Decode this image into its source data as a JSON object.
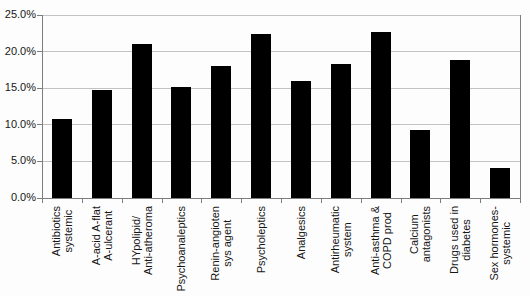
{
  "chart_data": {
    "type": "bar",
    "title": "",
    "categories": [
      "Antibiotics systemic",
      "A-acid A-flat A-ulcerant",
      "HYpolipid/ Anti-atheroma",
      "Psychoanaleptics",
      "Renin-angioten sys agent",
      "Psycholeptics",
      "Analgesics",
      "Antirheumatic system",
      "Anti-asthma & COPD prod",
      "Calcium antagonists",
      "Drugs used in diabetes",
      "Sex hormones- systemic"
    ],
    "category_lines": [
      [
        "Antibiotics",
        "systemic"
      ],
      [
        "A-acid A-flat",
        "A-ulcerant"
      ],
      [
        "HYpolipid/",
        "Anti-atheroma"
      ],
      [
        "Psychoanaleptics"
      ],
      [
        "Renin-angioten",
        "sys agent"
      ],
      [
        "Psycholeptics"
      ],
      [
        "Analgesics"
      ],
      [
        "Antirheumatic",
        "system"
      ],
      [
        "Anti-asthma &",
        "COPD prod"
      ],
      [
        "Calcium",
        "antagonists"
      ],
      [
        "Drugs used in",
        "diabetes"
      ],
      [
        "Sex hormones-",
        "systemic"
      ]
    ],
    "values": [
      10.8,
      14.7,
      21.0,
      15.2,
      18.0,
      22.4,
      16.0,
      18.3,
      22.7,
      9.3,
      18.9,
      4.1
    ],
    "unit": "%",
    "ylim": [
      0,
      25
    ],
    "ytick_values": [
      0,
      5,
      10,
      15,
      20,
      25
    ],
    "ytick_labels": [
      "0.0%",
      "5.0%",
      "10.0%",
      "15.0%",
      "20.0%",
      "25.0%"
    ],
    "xlabel": "",
    "ylabel": "",
    "grid": true,
    "legend": "none",
    "bar_color": "#000000",
    "gridline_color": "#c2c2c2",
    "axis_color": "#7d7d7d",
    "background_color": "#fdfdfd"
  }
}
